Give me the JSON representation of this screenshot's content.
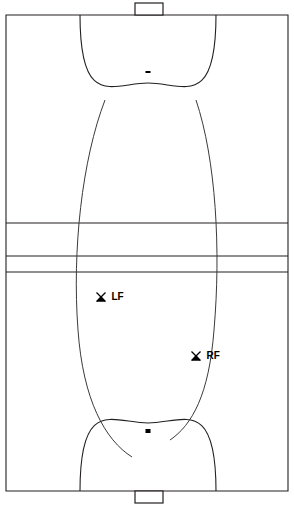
{
  "diagram": {
    "surface_color": "#ffffff",
    "line_color": "#231f20",
    "path_color": "#3a3a3c",
    "marker_color": "#000000"
  },
  "court": {
    "outline": {
      "x": 6,
      "y": 15,
      "width": 282,
      "height": 476
    },
    "center_lines": [
      {
        "name": "upper-center-line",
        "y": 223
      },
      {
        "name": "middle-center-line",
        "y": 256
      },
      {
        "name": "lower-center-line",
        "y": 272
      }
    ],
    "goals": [
      {
        "name": "top-goal",
        "x": 135,
        "y": 3,
        "width": 28,
        "height": 12
      },
      {
        "name": "bottom-goal",
        "x": 135,
        "y": 491,
        "width": 28,
        "height": 12
      }
    ],
    "goal_areas": [
      {
        "name": "top-goal-area-arc",
        "left_x": 80,
        "right_x": 216,
        "goal_line_y": 15,
        "apex_y": 83
      },
      {
        "name": "bottom-goal-area-arc",
        "left_x": 80,
        "right_x": 216,
        "goal_line_y": 491,
        "apex_y": 423
      }
    ],
    "penalty_marks": [
      {
        "name": "top-penalty-mark",
        "x": 148,
        "y": 72,
        "width": 5,
        "height": 2
      },
      {
        "name": "bottom-penalty-mark",
        "x": 148,
        "y": 431,
        "width": 5,
        "height": 4
      }
    ]
  },
  "movement_paths": [
    {
      "name": "left-wing-run",
      "d": "M 105 100 C 82 160, 72 250, 78 330 C 83 400, 105 440, 132 457"
    },
    {
      "name": "right-wing-run",
      "d": "M 196 100 C 216 160, 221 250, 214 330 C 209 395, 192 425, 170 440"
    }
  ],
  "position_markers": [
    {
      "name": "left-forward-marker",
      "label": "LF",
      "x": 101,
      "y": 297,
      "label_dx": 6,
      "label_dy": 3
    },
    {
      "name": "right-forward-marker",
      "label": "RF",
      "x": 196,
      "y": 356,
      "label_dx": 6,
      "label_dy": 3
    }
  ]
}
